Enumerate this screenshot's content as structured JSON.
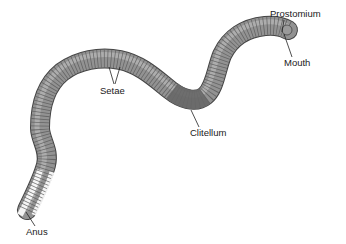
{
  "diagram": {
    "labels": {
      "prostomium": "Prostomium",
      "mouth": "Mouth",
      "setae": "Setae",
      "clitellum": "Clitellum",
      "anus": "Anus"
    },
    "colors": {
      "body": "#8a8a8a",
      "body_dark": "#5e5e5e",
      "body_light": "#b5b5b5",
      "clitellum": "#6a6a6a",
      "segment_lines": "#4a4a4a",
      "leader_lines": "#222222",
      "background": "#ffffff"
    }
  }
}
